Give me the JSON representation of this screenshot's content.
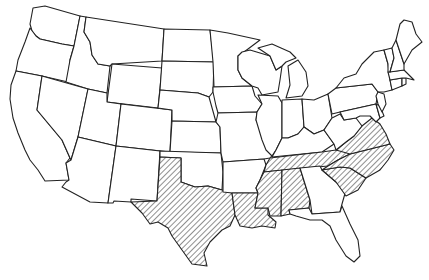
{
  "map": {
    "title": "",
    "region": "Contiguous United States",
    "style": {
      "background": "#ffffff",
      "stroke": "#222222",
      "hatch_color": "#333333"
    },
    "legend": [],
    "highlighted_states": [
      "Texas",
      "Louisiana",
      "Mississippi",
      "Alabama",
      "Tennessee",
      "Virginia",
      "North Carolina",
      "South Carolina"
    ],
    "states": [
      {
        "name": "Washington",
        "hatched": false
      },
      {
        "name": "Oregon",
        "hatched": false
      },
      {
        "name": "California",
        "hatched": false
      },
      {
        "name": "Idaho",
        "hatched": false
      },
      {
        "name": "Nevada",
        "hatched": false
      },
      {
        "name": "Montana",
        "hatched": false
      },
      {
        "name": "Wyoming",
        "hatched": false
      },
      {
        "name": "Utah",
        "hatched": false
      },
      {
        "name": "Arizona",
        "hatched": false
      },
      {
        "name": "Colorado",
        "hatched": false
      },
      {
        "name": "New Mexico",
        "hatched": false
      },
      {
        "name": "North Dakota",
        "hatched": false
      },
      {
        "name": "South Dakota",
        "hatched": false
      },
      {
        "name": "Nebraska",
        "hatched": false
      },
      {
        "name": "Kansas",
        "hatched": false
      },
      {
        "name": "Oklahoma",
        "hatched": false
      },
      {
        "name": "Texas",
        "hatched": true
      },
      {
        "name": "Minnesota",
        "hatched": false
      },
      {
        "name": "Iowa",
        "hatched": false
      },
      {
        "name": "Missouri",
        "hatched": false
      },
      {
        "name": "Arkansas",
        "hatched": false
      },
      {
        "name": "Louisiana",
        "hatched": true
      },
      {
        "name": "Wisconsin",
        "hatched": false
      },
      {
        "name": "Illinois",
        "hatched": false
      },
      {
        "name": "Michigan",
        "hatched": false
      },
      {
        "name": "Indiana",
        "hatched": false
      },
      {
        "name": "Ohio",
        "hatched": false
      },
      {
        "name": "Kentucky",
        "hatched": false
      },
      {
        "name": "Tennessee",
        "hatched": true
      },
      {
        "name": "Mississippi",
        "hatched": true
      },
      {
        "name": "Alabama",
        "hatched": true
      },
      {
        "name": "Georgia",
        "hatched": false
      },
      {
        "name": "Florida",
        "hatched": false
      },
      {
        "name": "South Carolina",
        "hatched": true
      },
      {
        "name": "North Carolina",
        "hatched": true
      },
      {
        "name": "Virginia",
        "hatched": true
      },
      {
        "name": "West Virginia",
        "hatched": false
      },
      {
        "name": "Pennsylvania",
        "hatched": false
      },
      {
        "name": "New York",
        "hatched": false
      },
      {
        "name": "Maryland",
        "hatched": false
      },
      {
        "name": "Delaware",
        "hatched": false
      },
      {
        "name": "New Jersey",
        "hatched": false
      },
      {
        "name": "Connecticut",
        "hatched": false
      },
      {
        "name": "Rhode Island",
        "hatched": false
      },
      {
        "name": "Massachusetts",
        "hatched": false
      },
      {
        "name": "Vermont",
        "hatched": false
      },
      {
        "name": "New Hampshire",
        "hatched": false
      },
      {
        "name": "Maine",
        "hatched": false
      }
    ]
  }
}
